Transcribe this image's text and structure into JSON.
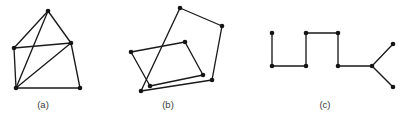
{
  "figure": {
    "background_color": "#ffffff",
    "edge_color": "#1a1a1a",
    "vertex_color": "#151515",
    "caption_color": "#3a3a3a",
    "width": 403,
    "height": 120,
    "subfigures": [
      {
        "id": "a",
        "label": "(a)",
        "description": "Five-vertex graph with crossing chords",
        "vertices": [
          {
            "name": "a-apex",
            "x": 48,
            "y": 11
          },
          {
            "name": "a-left",
            "x": 14,
            "y": 48
          },
          {
            "name": "a-right",
            "x": 71,
            "y": 43
          },
          {
            "name": "a-bottom-left",
            "x": 16,
            "y": 88
          },
          {
            "name": "a-bottom-right",
            "x": 80,
            "y": 88
          }
        ],
        "edges": [
          [
            "a-apex",
            "a-left"
          ],
          [
            "a-apex",
            "a-right"
          ],
          [
            "a-apex",
            "a-bottom-left"
          ],
          [
            "a-left",
            "a-right"
          ],
          [
            "a-left",
            "a-bottom-left"
          ],
          [
            "a-right",
            "a-bottom-left"
          ],
          [
            "a-right",
            "a-bottom-right"
          ],
          [
            "a-bottom-left",
            "a-bottom-right"
          ]
        ],
        "vertex_count": 5,
        "edge_count": 8
      },
      {
        "id": "b",
        "label": "(b)",
        "description": "Two overlapping quadrilaterals sharing no vertices",
        "vertices": [
          {
            "name": "b-q1-top",
            "x": 180,
            "y": 8
          },
          {
            "name": "b-q1-right",
            "x": 222,
            "y": 26
          },
          {
            "name": "b-q1-bottom",
            "x": 212,
            "y": 80
          },
          {
            "name": "b-q1-left",
            "x": 141,
            "y": 91
          },
          {
            "name": "b-q2-left",
            "x": 131,
            "y": 52
          },
          {
            "name": "b-q2-top",
            "x": 185,
            "y": 42
          },
          {
            "name": "b-q2-right",
            "x": 203,
            "y": 75
          },
          {
            "name": "b-q2-bottom",
            "x": 150,
            "y": 86
          }
        ],
        "edges": [
          [
            "b-q1-top",
            "b-q1-right"
          ],
          [
            "b-q1-right",
            "b-q1-bottom"
          ],
          [
            "b-q1-bottom",
            "b-q1-left"
          ],
          [
            "b-q1-left",
            "b-q1-top"
          ],
          [
            "b-q2-left",
            "b-q2-top"
          ],
          [
            "b-q2-top",
            "b-q2-right"
          ],
          [
            "b-q2-right",
            "b-q2-bottom"
          ],
          [
            "b-q2-bottom",
            "b-q2-left"
          ]
        ],
        "vertex_count": 8,
        "edge_count": 8
      },
      {
        "id": "c",
        "label": "(c)",
        "description": "Tree with a square-wave path and a two-branch fork",
        "vertices": [
          {
            "name": "c-v1",
            "x": 272,
            "y": 33
          },
          {
            "name": "c-v2",
            "x": 272,
            "y": 66
          },
          {
            "name": "c-v3",
            "x": 306,
            "y": 66
          },
          {
            "name": "c-v4",
            "x": 306,
            "y": 33
          },
          {
            "name": "c-v5",
            "x": 338,
            "y": 33
          },
          {
            "name": "c-v6",
            "x": 338,
            "y": 66
          },
          {
            "name": "c-v7",
            "x": 372,
            "y": 66
          },
          {
            "name": "c-v8",
            "x": 393,
            "y": 44
          },
          {
            "name": "c-v9",
            "x": 393,
            "y": 87
          }
        ],
        "edges": [
          [
            "c-v1",
            "c-v2"
          ],
          [
            "c-v2",
            "c-v3"
          ],
          [
            "c-v3",
            "c-v4"
          ],
          [
            "c-v4",
            "c-v5"
          ],
          [
            "c-v5",
            "c-v6"
          ],
          [
            "c-v6",
            "c-v7"
          ],
          [
            "c-v7",
            "c-v8"
          ],
          [
            "c-v7",
            "c-v9"
          ]
        ],
        "vertex_count": 9,
        "edge_count": 8
      }
    ]
  }
}
